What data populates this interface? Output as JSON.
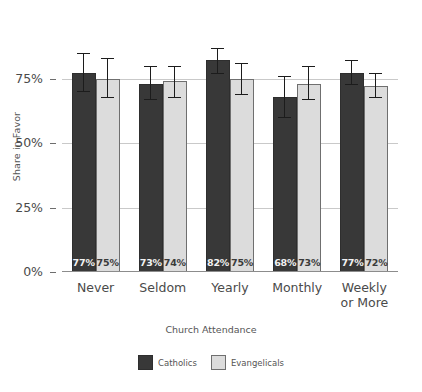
{
  "chart_data": {
    "type": "bar",
    "title": "",
    "xlabel": "Church Attendance",
    "ylabel": "Share in Favor",
    "ylim": [
      0,
      100
    ],
    "yticks": [
      0,
      25,
      50,
      75
    ],
    "ytick_labels": [
      "0%",
      "25%",
      "50%",
      "75%"
    ],
    "grid": true,
    "legend_position": "bottom",
    "categories": [
      "Never",
      "Seldom",
      "Yearly",
      "Monthly",
      "Weekly or More"
    ],
    "series": [
      {
        "name": "Catholics",
        "color": "#383838",
        "values": [
          77,
          73,
          82,
          68,
          77
        ],
        "labels": [
          "77%",
          "73%",
          "82%",
          "68%",
          "77%"
        ],
        "error_low": [
          70,
          67,
          77,
          60,
          73
        ],
        "error_high": [
          85,
          80,
          87,
          76,
          82
        ]
      },
      {
        "name": "Evangelicals",
        "color": "#dcdcdc",
        "values": [
          75,
          74,
          75,
          73,
          72
        ],
        "labels": [
          "75%",
          "74%",
          "75%",
          "73%",
          "72%"
        ],
        "error_low": [
          68,
          68,
          69,
          67,
          68
        ],
        "error_high": [
          83,
          80,
          81,
          80,
          77
        ]
      }
    ]
  },
  "axis": {
    "y_title": "Share in Favor",
    "x_title": "Church Attendance"
  },
  "legend": {
    "items": [
      {
        "label": "Catholics",
        "swatch": "dark-square-swatch"
      },
      {
        "label": "Evangelicals",
        "swatch": "light-square-swatch"
      }
    ]
  }
}
